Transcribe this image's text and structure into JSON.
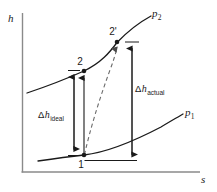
{
  "figure": {
    "kind": "enthalpy-entropy-diagram",
    "background_color": "#ffffff",
    "line_color": "#1a1a1a",
    "axis_color": "#8a8a8a",
    "dashed_color": "#6b6b6b"
  },
  "axes": {
    "y_label": "h",
    "x_label": "s",
    "y_axis_name": "enthalpy-axis",
    "x_axis_name": "entropy-axis"
  },
  "curves": {
    "upper": {
      "label_base": "p",
      "label_sub": "2",
      "name": "isobar-p2"
    },
    "lower": {
      "label_base": "p",
      "label_sub": "1",
      "name": "isobar-p1"
    }
  },
  "states": [
    {
      "id": "state-1",
      "label": "1",
      "x": 84,
      "y": 155
    },
    {
      "id": "state-2",
      "label": "2",
      "x": 84,
      "y": 71
    },
    {
      "id": "state-2-prime",
      "label": "2'",
      "x": 117,
      "y": 42
    }
  ],
  "measures": [
    {
      "id": "delta-h-ideal",
      "prefix": "Δ",
      "symbol": "h",
      "subscript": "ideal",
      "text": "Δh_ideal"
    },
    {
      "id": "delta-h-actual",
      "prefix": "Δ",
      "symbol": "h",
      "subscript": "actual",
      "text": "Δh_actual"
    }
  ],
  "processes": [
    {
      "id": "ideal-process",
      "from": "1",
      "to": "2",
      "style": "solid-arrow"
    },
    {
      "id": "actual-process",
      "from": "1",
      "to": "2'",
      "style": "dashed-arrow"
    }
  ]
}
